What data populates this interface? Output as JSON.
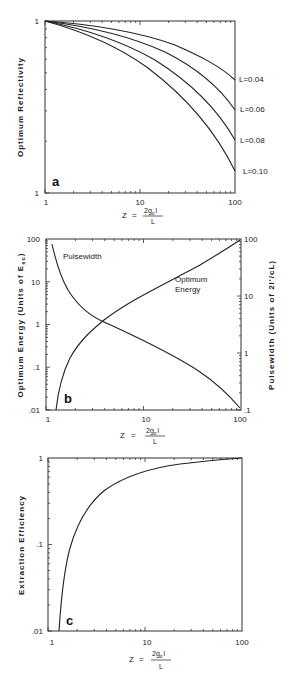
{
  "figure": {
    "x_axis_formula": {
      "lhs": "Z",
      "eq": "=",
      "numerator": "2g",
      "numerator_sub": "o",
      "numerator_tail": "l",
      "denominator": "L"
    }
  },
  "panels": [
    {
      "letter": "a",
      "ylabel": "Optimum Reflectivity",
      "x_ticks": [
        "1",
        "10",
        "100"
      ],
      "y_ticks": [
        "1",
        "1"
      ],
      "series_labels": [
        "L=0.04",
        "L=0.06",
        "L=0.08",
        "L=0.10"
      ]
    },
    {
      "letter": "b",
      "ylabel_left": "Optimum Energy (Units of E",
      "ylabel_left_sub": "sc",
      "ylabel_left_tail": ")",
      "ylabel_right": "Pulsewidth (Units of 2l'/cL)",
      "x_ticks": [
        "1",
        "10",
        "100"
      ],
      "y_ticks_left": [
        "100",
        "10",
        "1",
        ".1",
        ".01"
      ],
      "y_ticks_right": [
        "100",
        "10",
        "1",
        ".1"
      ],
      "annotations": [
        "Pulsewidth",
        "Optimum",
        "Energy"
      ]
    },
    {
      "letter": "c",
      "ylabel": "Extraction Efficiency",
      "x_ticks": [
        "1",
        "10",
        "100"
      ],
      "y_ticks": [
        "1",
        ".1",
        ".01"
      ]
    }
  ],
  "chart_data": [
    {
      "type": "line",
      "title": "a",
      "xlabel": "Z = 2g0 l / L",
      "ylabel": "Optimum Reflectivity",
      "xscale": "log",
      "xlim": [
        1,
        100
      ],
      "ylim_note": "log axis, both ends labeled 1 in source",
      "grid": false,
      "legend_position": "right (inline labels at curve ends)",
      "x": [
        1,
        2,
        5,
        10,
        20,
        50,
        100
      ],
      "series": [
        {
          "name": "L=0.04",
          "values": [
            1.0,
            0.99,
            0.975,
            0.95,
            0.91,
            0.82,
            0.7
          ]
        },
        {
          "name": "L=0.06",
          "values": [
            1.0,
            0.985,
            0.96,
            0.93,
            0.87,
            0.74,
            0.58
          ]
        },
        {
          "name": "L=0.08",
          "values": [
            1.0,
            0.98,
            0.95,
            0.91,
            0.83,
            0.66,
            0.46
          ]
        },
        {
          "name": "L=0.10",
          "values": [
            1.0,
            0.975,
            0.94,
            0.89,
            0.8,
            0.59,
            0.35
          ]
        }
      ]
    },
    {
      "type": "line",
      "title": "b",
      "xlabel": "Z = 2g0 l / L",
      "ylabel": "Optimum Energy (Units of Esc)",
      "ylabel_right": "Pulsewidth (Units of 2l'/cL)",
      "xscale": "log",
      "yscale": "log",
      "xlim": [
        1,
        100
      ],
      "ylim": [
        0.01,
        100
      ],
      "ylim_right": [
        0.1,
        100
      ],
      "grid": false,
      "series": [
        {
          "name": "Optimum Energy",
          "axis": "left",
          "x": [
            1.15,
            1.3,
            1.5,
            2,
            3,
            5,
            10,
            20,
            50,
            100
          ],
          "values": [
            0.01,
            0.04,
            0.09,
            0.25,
            0.8,
            2.2,
            6.8,
            17,
            50,
            100
          ]
        },
        {
          "name": "Pulsewidth",
          "axis": "right",
          "x": [
            1.1,
            1.3,
            1.5,
            2,
            3,
            5,
            10,
            20,
            50,
            100
          ],
          "values": [
            70,
            25,
            13,
            6,
            3,
            1.8,
            1.0,
            0.55,
            0.22,
            0.1
          ]
        }
      ]
    },
    {
      "type": "line",
      "title": "c",
      "xlabel": "Z = 2g0 l / L",
      "ylabel": "Extraction Efficiency",
      "xscale": "log",
      "yscale": "log",
      "xlim": [
        1,
        100
      ],
      "ylim": [
        0.01,
        1
      ],
      "grid": false,
      "series": [
        {
          "name": "Extraction Efficiency",
          "x": [
            1.15,
            1.3,
            1.5,
            2,
            3,
            5,
            10,
            20,
            50,
            100
          ],
          "values": [
            0.01,
            0.06,
            0.12,
            0.22,
            0.37,
            0.52,
            0.68,
            0.8,
            0.9,
            0.95
          ]
        }
      ]
    }
  ]
}
